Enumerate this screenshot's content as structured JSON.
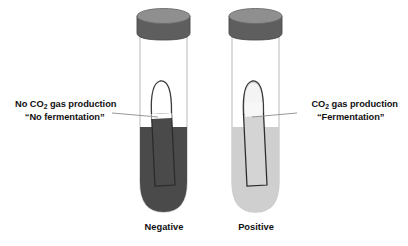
{
  "figure": {
    "title_present": false,
    "background_color": "#ffffff",
    "callouts": [
      {
        "id": "no-gas",
        "line1_pre": "No CO",
        "line1_sub": "2",
        "line1_post": " gas production",
        "line2": "“No fermentation”",
        "side": "left",
        "leader_color": "#8c8c8c"
      },
      {
        "id": "gas",
        "line1_pre": "CO",
        "line1_sub": "2",
        "line1_post": " gas production",
        "line2": "“Fermentation”",
        "side": "right",
        "leader_color": "#8c8c8c"
      }
    ],
    "tubes": [
      {
        "id": "negative",
        "caption": "Negative",
        "cap_color": "#5e5e5e",
        "cap_top_color": "#8f8f8f",
        "glass_color": "#c9c9c9",
        "broth_color": "#4a4a4a",
        "durham_fill_color": "#4a4a4a",
        "durham_outline_color": "#2b2b2b",
        "gas_bubble": false,
        "gas_bubble_color": "#ffffff",
        "result": "No gas trapped in Durham tube"
      },
      {
        "id": "positive",
        "caption": "Positive",
        "cap_color": "#5e5e5e",
        "cap_top_color": "#8f8f8f",
        "glass_color": "#c9c9c9",
        "broth_color": "#cfcfcf",
        "durham_fill_color": "#d4d4d4",
        "durham_outline_color": "#2b2b2b",
        "gas_bubble": true,
        "gas_bubble_color": "#f4f4f4",
        "result": "Gas bubble trapped in Durham tube"
      }
    ]
  }
}
